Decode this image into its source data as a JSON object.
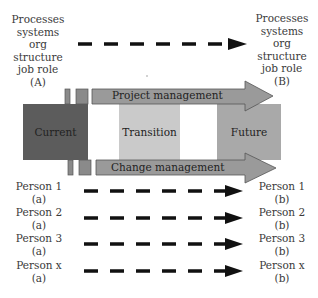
{
  "top_row": {
    "from_label": [
      "Processes",
      "systems",
      "org structure",
      "job role",
      "(A)"
    ],
    "to_label": [
      "Processes",
      "systems",
      "org structure",
      "job role",
      "(B)"
    ]
  },
  "states": {
    "current": {
      "label": "Current",
      "color": "#5c5c5c"
    },
    "transition": {
      "label": "Transition",
      "color": "#cacaca"
    },
    "future": {
      "label": "Future",
      "color": "#a9a9a9"
    }
  },
  "arrows": {
    "project_management": {
      "label": "Project management",
      "color": "#9a9a9a"
    },
    "change_management": {
      "label": "Change management",
      "color": "#9a9a9a"
    }
  },
  "people": [
    {
      "name": "Person 1",
      "from": "(a)",
      "to": "(b)"
    },
    {
      "name": "Person 2",
      "from": "(a)",
      "to": "(b)"
    },
    {
      "name": "Person 3",
      "from": "(a)",
      "to": "(b)"
    },
    {
      "name": "Person x",
      "from": "(a)",
      "to": "(b)"
    }
  ]
}
